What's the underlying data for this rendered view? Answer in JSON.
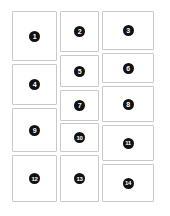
{
  "board": {
    "title": "Numbered Card Grid",
    "background_color": "#ffffff",
    "card_background_color": "#ffffff",
    "card_border_color": "#c9c9c9",
    "badge_background_color": "#111111",
    "badge_text_color": "#ffffff",
    "column_count": 3,
    "card_count": 14
  },
  "columns": [
    {
      "name": "column-1",
      "cards": [
        {
          "label": "1",
          "x": 12,
          "y": 11,
          "w": 45,
          "h": 50
        },
        {
          "label": "4",
          "x": 12,
          "y": 64,
          "w": 45,
          "h": 41
        },
        {
          "label": "9",
          "x": 12,
          "y": 108,
          "w": 45,
          "h": 44
        },
        {
          "label": "12",
          "x": 12,
          "y": 155,
          "w": 45,
          "h": 47
        }
      ]
    },
    {
      "name": "column-2",
      "cards": [
        {
          "label": "2",
          "x": 60,
          "y": 11,
          "w": 39,
          "h": 41
        },
        {
          "label": "5",
          "x": 60,
          "y": 55,
          "w": 39,
          "h": 32
        },
        {
          "label": "7",
          "x": 60,
          "y": 90,
          "w": 39,
          "h": 31
        },
        {
          "label": "10",
          "x": 60,
          "y": 123,
          "w": 39,
          "h": 29
        },
        {
          "label": "13",
          "x": 60,
          "y": 155,
          "w": 39,
          "h": 47
        }
      ]
    },
    {
      "name": "column-3",
      "cards": [
        {
          "label": "3",
          "x": 102,
          "y": 11,
          "w": 52,
          "h": 39
        },
        {
          "label": "6",
          "x": 102,
          "y": 53,
          "w": 52,
          "h": 30
        },
        {
          "label": "8",
          "x": 102,
          "y": 86,
          "w": 52,
          "h": 36
        },
        {
          "label": "11",
          "x": 102,
          "y": 125,
          "w": 52,
          "h": 36
        },
        {
          "label": "14",
          "x": 102,
          "y": 164,
          "w": 52,
          "h": 38
        }
      ]
    }
  ]
}
